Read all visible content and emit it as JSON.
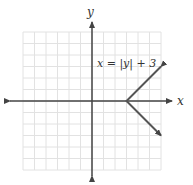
{
  "chart_data": {
    "type": "line",
    "title": "",
    "equation_label": "x = |y| + 3",
    "xlabel": "x",
    "ylabel": "y",
    "xlim": [
      -6,
      6
    ],
    "ylim": [
      -6,
      6
    ],
    "grid": true,
    "series": [
      {
        "name": "x = |y| + 3",
        "points": [
          [
            6,
            3
          ],
          [
            3,
            0
          ],
          [
            6,
            -3
          ]
        ],
        "arrows_at_ends": true
      }
    ]
  },
  "labels": {
    "x_axis": "x",
    "y_axis": "y",
    "equation": "x = |y| + 3"
  }
}
